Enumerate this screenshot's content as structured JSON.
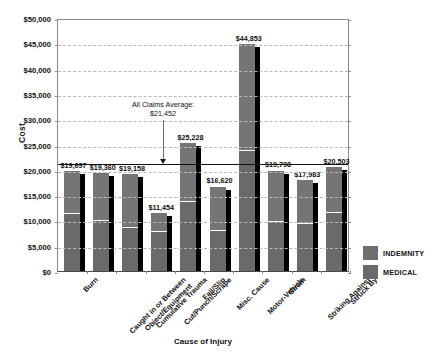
{
  "chart_data": {
    "type": "bar",
    "title": "",
    "xlabel": "Cause of Injury",
    "ylabel": "Cost",
    "ylim": [
      0,
      50000
    ],
    "ytick_labels": [
      "$50,000",
      "$45,000",
      "$40,000",
      "$35,000",
      "$30,000",
      "$25,000",
      "$20,000",
      "$15,000",
      "$10,000",
      "$5,000",
      "$0"
    ],
    "ytick_values": [
      50000,
      45000,
      40000,
      35000,
      30000,
      25000,
      20000,
      15000,
      10000,
      5000,
      0
    ],
    "grid": true,
    "legend_position": "right",
    "stacked": true,
    "categories": [
      "Burn",
      "Caught in or Between Object/Equipment",
      "Cumulative Trauma",
      "Cut/Punch/Scrape",
      "Fall/Slip",
      "Misc. Cause",
      "Motor-Vehicle",
      "Strain",
      "Striking Against",
      "Struck By"
    ],
    "category_label_lines": [
      [
        "Burn"
      ],
      [
        "Caught in or Between",
        "Object/Equipment"
      ],
      [
        "Cumulative Trauma"
      ],
      [
        "Cut/Punch/Scrape"
      ],
      [
        "Fall/Slip"
      ],
      [
        "Misc. Cause"
      ],
      [
        "Motor-Vehicle"
      ],
      [
        "Strain"
      ],
      [
        "Striking Against"
      ],
      [
        "Struck By"
      ]
    ],
    "values": [
      19697,
      19360,
      19158,
      11454,
      25228,
      16620,
      44853,
      19798,
      17983,
      20503
    ],
    "value_labels": [
      "$19,697",
      "$19,360",
      "$19,158",
      "$11,454",
      "$25,228",
      "$16,620",
      "$44,853",
      "$19,798",
      "$17,983",
      "$20,503"
    ],
    "series": [
      {
        "name": "INDEMNITY",
        "color": "#6a6a6a",
        "values": [
          11500,
          10000,
          8700,
          7900,
          13800,
          8200,
          24000,
          9900,
          9400,
          11700
        ]
      },
      {
        "name": "MEDICAL",
        "color": "#757575",
        "values": [
          8197,
          9360,
          10458,
          3554,
          11428,
          8420,
          20853,
          9898,
          8583,
          8803
        ]
      }
    ],
    "reference_line": {
      "label_line1": "All Claims Average:",
      "label_line2": "$21,452",
      "value": 21452
    }
  },
  "legend": {
    "items": [
      {
        "label": "INDEMNITY",
        "color": "#6f6f6f"
      },
      {
        "label": "MEDICAL",
        "color": "#6a6a6a"
      }
    ]
  }
}
